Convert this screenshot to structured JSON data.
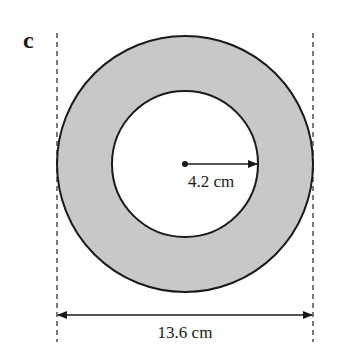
{
  "part_label": "c",
  "figure": {
    "shape": "annulus",
    "inner_radius_label": "4.2 cm",
    "outer_diameter_label": "13.6 cm",
    "colors": {
      "ring_fill": "#c8c8c8",
      "stroke": "#1a1a1a",
      "background": "#ffffff"
    }
  }
}
